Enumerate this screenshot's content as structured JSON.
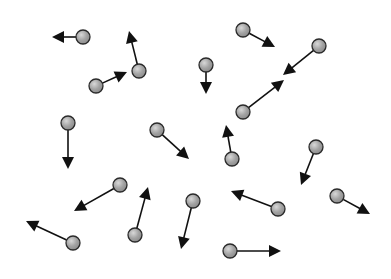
{
  "diagram": {
    "type": "particle-velocity-diagram",
    "ball_color": "#a3a3a3",
    "ball_highlight": "#d8d8d8",
    "ball_outline": "#2a2a2a",
    "arrow_color": "#111111",
    "ball_radius": 7,
    "particles": [
      {
        "id": "A",
        "x": 83,
        "y": 37,
        "tip_x": 52,
        "tip_y": 37
      },
      {
        "id": "B",
        "x": 139,
        "y": 71,
        "tip_x": 129,
        "tip_y": 31
      },
      {
        "id": "C",
        "x": 96,
        "y": 86,
        "tip_x": 127,
        "tip_y": 72
      },
      {
        "id": "D",
        "x": 243,
        "y": 30,
        "tip_x": 275,
        "tip_y": 47
      },
      {
        "id": "E",
        "x": 319,
        "y": 46,
        "tip_x": 283,
        "tip_y": 75
      },
      {
        "id": "F",
        "x": 206,
        "y": 65,
        "tip_x": 206,
        "tip_y": 94
      },
      {
        "id": "G",
        "x": 243,
        "y": 112,
        "tip_x": 284,
        "tip_y": 80
      },
      {
        "id": "H",
        "x": 68,
        "y": 123,
        "tip_x": 68,
        "tip_y": 169
      },
      {
        "id": "I",
        "x": 157,
        "y": 130,
        "tip_x": 189,
        "tip_y": 159
      },
      {
        "id": "J",
        "x": 232,
        "y": 159,
        "tip_x": 226,
        "tip_y": 125
      },
      {
        "id": "K",
        "x": 316,
        "y": 147,
        "tip_x": 301,
        "tip_y": 185
      },
      {
        "id": "L",
        "x": 120,
        "y": 185,
        "tip_x": 74,
        "tip_y": 211
      },
      {
        "id": "M",
        "x": 73,
        "y": 243,
        "tip_x": 26,
        "tip_y": 221
      },
      {
        "id": "N",
        "x": 135,
        "y": 235,
        "tip_x": 148,
        "tip_y": 187
      },
      {
        "id": "O",
        "x": 193,
        "y": 201,
        "tip_x": 181,
        "tip_y": 249
      },
      {
        "id": "P",
        "x": 278,
        "y": 209,
        "tip_x": 231,
        "tip_y": 191
      },
      {
        "id": "Q",
        "x": 337,
        "y": 196,
        "tip_x": 370,
        "tip_y": 214
      },
      {
        "id": "R",
        "x": 230,
        "y": 251,
        "tip_x": 281,
        "tip_y": 251
      }
    ]
  }
}
